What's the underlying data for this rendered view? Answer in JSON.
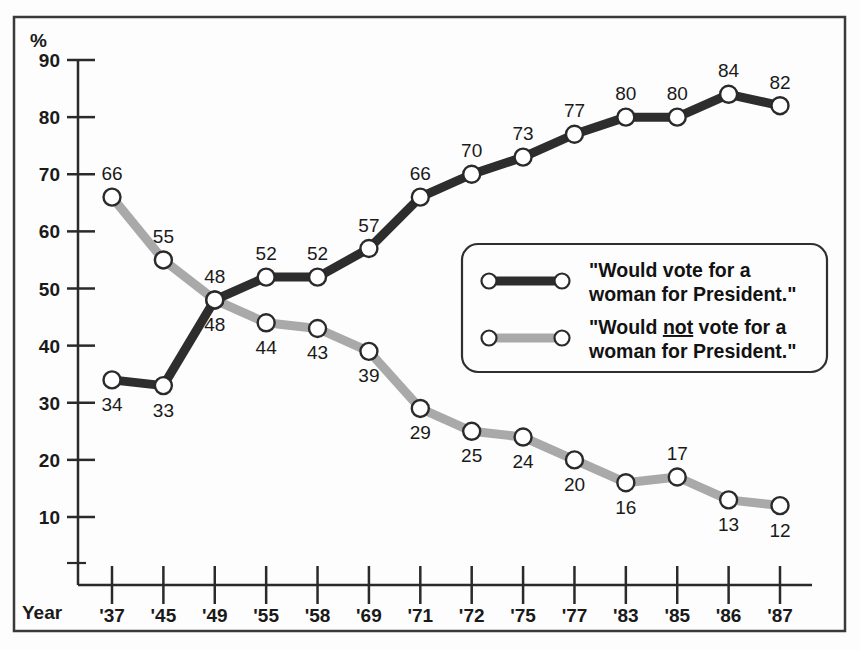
{
  "chart_data": {
    "type": "line",
    "title": "",
    "subtitle": "",
    "xlabel": "Year",
    "ylabel": "%",
    "categories": [
      "'37",
      "'45",
      "'49",
      "'55",
      "'58",
      "'69",
      "'71",
      "'72",
      "'75",
      "'77",
      "'83",
      "'85",
      "'86",
      "'87"
    ],
    "ylim": [
      10,
      90
    ],
    "ytick_labels": [
      "90",
      "80",
      "70",
      "60",
      "50",
      "40",
      "30",
      "20",
      "10"
    ],
    "yticks": [
      90,
      80,
      70,
      60,
      50,
      40,
      30,
      20,
      10
    ],
    "grid": false,
    "legend_position": "center-right inside plot",
    "series": [
      {
        "name": "\"Would vote for a woman for President.\"",
        "color": "#2d2d2d",
        "values": [
          34,
          33,
          48,
          52,
          52,
          57,
          66,
          70,
          73,
          77,
          80,
          80,
          84,
          82
        ],
        "labels": [
          "34",
          "33",
          "48",
          "52",
          "52",
          "57",
          "66",
          "70",
          "73",
          "77",
          "80",
          "80",
          "84",
          "82"
        ],
        "label_positions": [
          "below",
          "below",
          "below",
          "above",
          "above",
          "above",
          "above",
          "above",
          "above",
          "above",
          "above",
          "above",
          "above",
          "above"
        ]
      },
      {
        "name": "\"Would not vote for a woman for President.\"",
        "color": "#a9a9a9",
        "values": [
          66,
          55,
          48,
          44,
          43,
          39,
          29,
          25,
          24,
          20,
          16,
          17,
          13,
          12
        ],
        "labels": [
          "66",
          "55",
          "48",
          "44",
          "43",
          "39",
          "29",
          "25",
          "24",
          "20",
          "16",
          "17",
          "13",
          "12"
        ],
        "label_positions": [
          "above",
          "above",
          "above",
          "below",
          "below",
          "below",
          "below",
          "below",
          "below",
          "below",
          "below",
          "above",
          "below",
          "below"
        ]
      }
    ]
  },
  "axes": {
    "y_unit_label": "%",
    "x_axis_title": "Year"
  },
  "legend": {
    "entries": [
      {
        "swatch": "dark-line-swatch",
        "line1": "\"Would vote for a",
        "line2": "woman for President.\"",
        "underline_word": ""
      },
      {
        "swatch": "gray-line-swatch",
        "line1_pre": "\"Would ",
        "line1_underlined": "not",
        "line1_post": " vote for a",
        "line2": "woman for President.\"",
        "underline_word": "not"
      }
    ]
  },
  "colors": {
    "series_dark": "#2d2d2d",
    "series_gray": "#a9a9a9",
    "axis": "#2a2a2a",
    "frame": "#3a3a3a",
    "background": "#fdfdfd",
    "marker_fill": "#ffffff",
    "text": "#1a1a1a"
  }
}
